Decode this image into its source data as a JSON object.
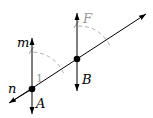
{
  "diagram": {
    "lines": {
      "n": {
        "label": "n",
        "from": [
          9,
          103
        ],
        "to": [
          146,
          14
        ]
      },
      "m": {
        "label": "m",
        "from": [
          32,
          114
        ],
        "to": [
          32,
          38
        ]
      },
      "through_B": {
        "label": "",
        "from": [
          77,
          91
        ],
        "to": [
          77,
          13
        ]
      }
    },
    "points": {
      "A": {
        "label": "A",
        "x": 32,
        "y": 89
      },
      "B": {
        "label": "B",
        "x": 77,
        "y": 59
      }
    },
    "labels": {
      "m": "m",
      "n": "n",
      "A": "A",
      "B": "B",
      "F": "F",
      "angle1": "1"
    },
    "colors": {
      "line": "#000000",
      "construction": "#a0a0a0"
    }
  }
}
